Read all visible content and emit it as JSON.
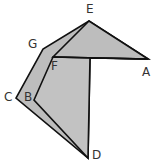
{
  "diagram": {
    "type": "geometric-fold-figure",
    "colors": {
      "fill": "#bdbdbd",
      "fill_front": "#c4c4c4",
      "stroke": "#111111",
      "label": "#333333",
      "background": "#ffffff"
    },
    "points": {
      "A": [
        148,
        59
      ],
      "B": [
        34,
        100
      ],
      "C": [
        16,
        98
      ],
      "D": [
        88,
        158
      ],
      "E": [
        89,
        21
      ],
      "F": [
        53,
        57
      ],
      "G": [
        43,
        49
      ]
    },
    "labels": [
      {
        "text": "E",
        "x": 86,
        "y": 13
      },
      {
        "text": "G",
        "x": 28,
        "y": 48
      },
      {
        "text": "F",
        "x": 51,
        "y": 70
      },
      {
        "text": "A",
        "x": 142,
        "y": 76
      },
      {
        "text": "C",
        "x": 4,
        "y": 100
      },
      {
        "text": "B",
        "x": 24,
        "y": 101
      },
      {
        "text": "D",
        "x": 92,
        "y": 159
      }
    ]
  }
}
